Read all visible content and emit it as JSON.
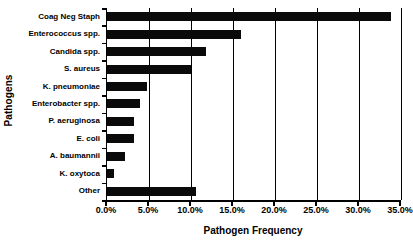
{
  "chart_data": {
    "type": "bar",
    "orientation": "horizontal",
    "title": "",
    "xlabel": "Pathogen Frequency",
    "ylabel": "Pathogens",
    "categories": [
      "Coag Neg Staph",
      "Enterococcus spp.",
      "Candida spp.",
      "S. aureus",
      "K. pneumoniae",
      "Enterobacter spp.",
      "P. aeruginosa",
      "E. coli",
      "A. baumannii",
      "K. oxytoca",
      "Other"
    ],
    "values": [
      33.8,
      16.0,
      11.8,
      10.0,
      4.8,
      3.9,
      3.2,
      3.2,
      2.2,
      0.8,
      10.6
    ],
    "xlim": [
      0.0,
      35.0
    ],
    "xticks": [
      0.0,
      5.0,
      10.0,
      15.0,
      20.0,
      25.0,
      30.0,
      35.0
    ],
    "xtick_labels": [
      "0.0%",
      "5.0%",
      "10.0%",
      "15.0%",
      "20.0%",
      "25.0%",
      "30.0%",
      "35.0%"
    ],
    "grid": "vertical",
    "legend": null,
    "bar_color": "#0a0a0a",
    "axis_color": "#000000",
    "background": "#ffffff"
  }
}
